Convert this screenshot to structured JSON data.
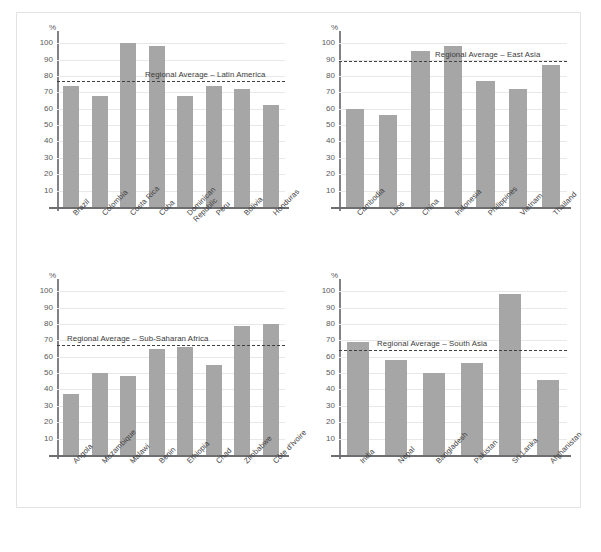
{
  "figure": {
    "axis_unit": "%",
    "y_ticks": [
      10,
      20,
      30,
      40,
      50,
      60,
      70,
      80,
      90,
      100
    ],
    "bar_color": "#a6a6a6",
    "gridline_color": "#e8e8e8",
    "average_line_color": "#404040"
  },
  "chart_data": [
    {
      "type": "bar",
      "title": "",
      "xlabel": "",
      "ylabel": "%",
      "ylim": [
        0,
        105
      ],
      "grid": true,
      "legend": "none",
      "categories": [
        "Brazil",
        "Colombia",
        "Costa Rica",
        "Cuba",
        "Dominican Republic",
        "Peru",
        "Bolivia",
        "Honduras"
      ],
      "values": [
        74,
        68,
        100,
        98,
        68,
        74,
        72,
        62
      ],
      "annotations": [
        {
          "label": "Regional Average – Latin America",
          "type": "reference-line",
          "value": 77
        }
      ]
    },
    {
      "type": "bar",
      "title": "",
      "xlabel": "",
      "ylabel": "%",
      "ylim": [
        0,
        105
      ],
      "grid": true,
      "legend": "none",
      "categories": [
        "Cambodia",
        "Laos",
        "China",
        "Indonesia",
        "Philippines",
        "Vietnam",
        "Thailand"
      ],
      "values": [
        60,
        56,
        95,
        98,
        77,
        72,
        87
      ],
      "annotations": [
        {
          "label": "Regional Average – East Asia",
          "type": "reference-line",
          "value": 89
        }
      ]
    },
    {
      "type": "bar",
      "title": "",
      "xlabel": "",
      "ylabel": "%",
      "ylim": [
        0,
        105
      ],
      "grid": true,
      "legend": "none",
      "categories": [
        "Angola",
        "Mozambique",
        "Malawi",
        "Benin",
        "Ethiopia",
        "Chad",
        "Zimbabwe",
        "Côte d'Ivoire"
      ],
      "values": [
        37,
        50,
        48,
        65,
        66,
        55,
        79,
        80
      ],
      "annotations": [
        {
          "label": "Regional Average – Sub-Saharan Africa",
          "type": "reference-line",
          "value": 67
        }
      ]
    },
    {
      "type": "bar",
      "title": "",
      "xlabel": "",
      "ylabel": "%",
      "ylim": [
        0,
        105
      ],
      "grid": true,
      "legend": "none",
      "categories": [
        "India",
        "Nepal",
        "Bangladesh",
        "Pakistan",
        "Sri Lanka",
        "Afghanistan"
      ],
      "values": [
        69,
        58,
        50,
        56,
        98,
        46
      ],
      "annotations": [
        {
          "label": "Regional Average – South Asia",
          "type": "reference-line",
          "value": 64
        }
      ]
    }
  ]
}
